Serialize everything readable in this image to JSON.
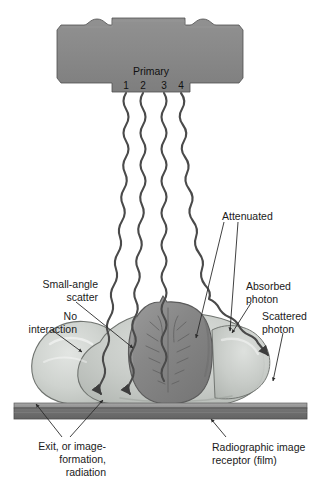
{
  "figure": {
    "background_color": "#ffffff"
  },
  "xray_tube": {
    "name": "x-ray-tube-housing",
    "fill_color": "#8a8a8a",
    "stroke_color": "#4f4f4f"
  },
  "beam_labels": {
    "primary": "Primary",
    "numbers": [
      "1",
      "2",
      "3",
      "4"
    ]
  },
  "annotations": {
    "small_angle_scatter": {
      "lines": [
        "Small-angle",
        "scatter"
      ],
      "align": "right"
    },
    "no_interaction": {
      "lines": [
        "No",
        "interaction"
      ],
      "align": "right"
    },
    "attenuated": {
      "lines": [
        "Attenuated"
      ],
      "align": "left"
    },
    "absorbed_photon": {
      "lines": [
        "Absorbed",
        "photon"
      ],
      "align": "left"
    },
    "scattered_photon": {
      "lines": [
        "Scattered",
        "photon"
      ],
      "align": "left"
    },
    "exit_radiation": {
      "lines": [
        "Exit, or image-",
        "formation,",
        "radiation"
      ],
      "align": "right"
    },
    "image_receptor": {
      "lines": [
        "Radiographic image",
        "receptor (film)"
      ],
      "align": "left"
    }
  },
  "anatomy": {
    "soft_tissue_name": "soft-tissue-cross-section",
    "soft_tissue_color": "#c9cdc9",
    "organ_name": "central-organ-vertebra",
    "organ_color": "#8b8b8b"
  },
  "receptor": {
    "name": "radiographic-film-receptor",
    "top_stripe_color": "#9a9a9a",
    "body_color": "#6e6e6e"
  },
  "colors": {
    "beam_stroke": "#4a4a4a",
    "leader_stroke": "#2b2b2b",
    "text": "#1a1a1a"
  }
}
